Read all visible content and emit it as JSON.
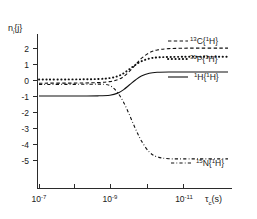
{
  "chart_data": {
    "type": "line",
    "title": "",
    "subtitle": "",
    "ylabel": "n_i{j}",
    "ylabel_base": "n",
    "ylabel_sub": "i",
    "ylabel_braces": "{j}",
    "xlabel": "τ_c(s)",
    "xlabel_base": "τ",
    "xlabel_sub": "c",
    "xlabel_tail": "(s)",
    "x_scale": "log-decreasing",
    "x_tick_labels": [
      "10⁻⁷",
      "10⁻⁹",
      "10⁻¹¹"
    ],
    "x_ticks": [
      {
        "mantissa": "10",
        "exponent": "-7",
        "px": 39
      },
      {
        "mantissa": "10",
        "exponent": "-9",
        "px": 110
      },
      {
        "mantissa": "10",
        "exponent": "-11",
        "px": 183
      }
    ],
    "x_minor_tick_px": [
      74,
      147
    ],
    "xlim_decades": [
      -7,
      -11.8
    ],
    "y_ticks": [
      2,
      1,
      0,
      -1,
      -2,
      -3,
      -4,
      -5
    ],
    "y_tick_px": [
      48,
      64,
      80,
      96,
      112,
      128,
      144,
      160
    ],
    "ylim": [
      -5.9,
      2.7
    ],
    "grid": false,
    "legend_position": "right-inline",
    "axis_color": "#2b2b2b",
    "curve_color": "#111111",
    "series": [
      {
        "name": "13C{1H}",
        "isotope_sup": "13",
        "isotope_sym": "C",
        "observed_sup": "1",
        "observed_sym": "H",
        "style": "dashed",
        "label_px": {
          "x": 190,
          "y": 41
        },
        "plateau_left": -0.2,
        "plateau_right": 1.99,
        "points": [
          [
            -7.0,
            -0.2
          ],
          [
            -8.0,
            -0.19
          ],
          [
            -8.5,
            -0.16
          ],
          [
            -8.8,
            -0.1
          ],
          [
            -9.0,
            0.02
          ],
          [
            -9.15,
            0.22
          ],
          [
            -9.3,
            0.55
          ],
          [
            -9.45,
            0.95
          ],
          [
            -9.6,
            1.35
          ],
          [
            -9.8,
            1.7
          ],
          [
            -10.0,
            1.88
          ],
          [
            -10.3,
            1.96
          ],
          [
            -10.8,
            1.99
          ],
          [
            -11.8,
            1.99
          ]
        ]
      },
      {
        "name": "31P{1H}",
        "isotope_sup": "31",
        "isotope_sym": "P",
        "observed_sup": "1",
        "observed_sym": "H",
        "style": "dotted",
        "label_px": {
          "x": 190,
          "y": 59
        },
        "plateau_left": 0.03,
        "plateau_right": 1.45,
        "points": [
          [
            -7.0,
            0.03
          ],
          [
            -8.0,
            0.04
          ],
          [
            -8.5,
            0.06
          ],
          [
            -8.8,
            0.12
          ],
          [
            -9.0,
            0.24
          ],
          [
            -9.15,
            0.42
          ],
          [
            -9.3,
            0.68
          ],
          [
            -9.45,
            0.95
          ],
          [
            -9.6,
            1.17
          ],
          [
            -9.8,
            1.34
          ],
          [
            -10.0,
            1.41
          ],
          [
            -10.3,
            1.44
          ],
          [
            -10.8,
            1.45
          ],
          [
            -11.8,
            1.45
          ]
        ]
      },
      {
        "name": "1H{1H}",
        "isotope_sup": "1",
        "isotope_sym": "H",
        "observed_sup": "1",
        "observed_sym": "H",
        "style": "solid",
        "label_px": {
          "x": 190,
          "y": 77
        },
        "plateau_left": -1.0,
        "plateau_right": 0.5,
        "points": [
          [
            -7.0,
            -1.0
          ],
          [
            -8.0,
            -1.0
          ],
          [
            -8.5,
            -0.99
          ],
          [
            -8.8,
            -0.95
          ],
          [
            -9.0,
            -0.82
          ],
          [
            -9.15,
            -0.6
          ],
          [
            -9.3,
            -0.3
          ],
          [
            -9.45,
            0.0
          ],
          [
            -9.6,
            0.25
          ],
          [
            -9.8,
            0.42
          ],
          [
            -10.0,
            0.48
          ],
          [
            -10.3,
            0.5
          ],
          [
            -10.8,
            0.5
          ],
          [
            -11.8,
            0.5
          ]
        ]
      },
      {
        "name": "15N{1H}",
        "isotope_sup": "15",
        "isotope_sym": "N",
        "observed_sup": "1",
        "observed_sym": "H",
        "style": "dashdot",
        "label_px": {
          "x": 193,
          "y": 163
        },
        "plateau_left": -0.28,
        "plateau_right": -4.93,
        "points": [
          [
            -7.0,
            -0.28
          ],
          [
            -8.0,
            -0.27
          ],
          [
            -8.5,
            -0.26
          ],
          [
            -8.7,
            -0.28
          ],
          [
            -8.85,
            -0.42
          ],
          [
            -9.0,
            -0.8
          ],
          [
            -9.15,
            -1.4
          ],
          [
            -9.3,
            -2.2
          ],
          [
            -9.45,
            -3.05
          ],
          [
            -9.6,
            -3.8
          ],
          [
            -9.8,
            -4.5
          ],
          [
            -10.0,
            -4.8
          ],
          [
            -10.3,
            -4.92
          ],
          [
            -10.8,
            -4.93
          ],
          [
            -11.8,
            -4.93
          ]
        ]
      }
    ]
  },
  "figure": {
    "background": "#ffffff",
    "caption": ""
  }
}
